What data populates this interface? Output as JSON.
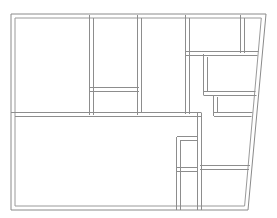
{
  "document": {
    "type": "architectural-floor-plan",
    "title": "Floor Plan",
    "canvas_width": 277,
    "canvas_height": 218,
    "background_color": "#ffffff",
    "wall_stroke_color": "#8d8d8d",
    "wall_style": "double-line",
    "wall_thickness_px": 4
  },
  "geometry": {
    "outline": {
      "name": "building-outline",
      "description": "Rectangular plan with slanted right edge",
      "outer_points": [
        [
          11,
          14
        ],
        [
          266,
          14
        ],
        [
          248,
          210
        ],
        [
          11,
          210
        ]
      ],
      "inner_points": [
        [
          15,
          18
        ],
        [
          261,
          18
        ],
        [
          244,
          206
        ],
        [
          15,
          206
        ]
      ]
    },
    "interior_walls": [
      {
        "name": "wall-vertical-left-room-right-edge",
        "orientation": "vertical",
        "x": 91,
        "y1": 14,
        "y2": 115
      },
      {
        "name": "wall-horizontal-upper-middle-stub",
        "orientation": "horizontal",
        "y": 89,
        "x1": 91,
        "x2": 139
      },
      {
        "name": "wall-vertical-center",
        "orientation": "vertical",
        "x": 139,
        "y1": 14,
        "y2": 115
      },
      {
        "name": "wall-horizontal-main-divider",
        "orientation": "horizontal",
        "y": 115,
        "x1": 11,
        "x2": 200
      },
      {
        "name": "wall-vertical-right-corridor-left",
        "orientation": "vertical",
        "x": 187,
        "y1": 14,
        "y2": 115
      },
      {
        "name": "wall-horizontal-right-corridor-top-divider",
        "orientation": "horizontal",
        "y": 53,
        "x1": 187,
        "x2": 258
      },
      {
        "name": "wall-vertical-top-right-small-room",
        "orientation": "vertical",
        "x": 242,
        "y1": 14,
        "y2": 53
      },
      {
        "name": "wall-vertical-upper-right-room-left",
        "orientation": "vertical",
        "x": 203,
        "y1": 55,
        "y2": 95
      },
      {
        "name": "wall-horizontal-upper-right-room-bottom",
        "orientation": "horizontal",
        "y": 95,
        "x1": 203,
        "x2": 256
      },
      {
        "name": "wall-vertical-mid-right-small-room-left",
        "orientation": "vertical",
        "x": 214,
        "y1": 95,
        "y2": 115
      },
      {
        "name": "wall-horizontal-mid-right-small-room-bottom",
        "orientation": "horizontal",
        "y": 115,
        "x1": 214,
        "x2": 253
      },
      {
        "name": "wall-vertical-lower-center-right",
        "orientation": "vertical",
        "x": 200,
        "y1": 115,
        "y2": 210
      },
      {
        "name": "wall-vertical-lower-narrow-room-left",
        "orientation": "vertical",
        "x": 178,
        "y1": 138,
        "y2": 210
      },
      {
        "name": "wall-horizontal-lower-narrow-room-top",
        "orientation": "horizontal",
        "y": 138,
        "x1": 178,
        "x2": 200
      },
      {
        "name": "wall-horizontal-lower-narrow-room-split",
        "orientation": "horizontal",
        "y": 170,
        "x1": 178,
        "x2": 200
      },
      {
        "name": "wall-horizontal-lower-right-room-top",
        "orientation": "horizontal",
        "y": 168,
        "x1": 200,
        "x2": 250
      }
    ],
    "rooms": [
      {
        "name": "room-top-left",
        "bounds": [
          15,
          18,
          89,
          113
        ]
      },
      {
        "name": "room-top-center-upper",
        "bounds": [
          93,
          18,
          137,
          87
        ]
      },
      {
        "name": "room-center",
        "bounds": [
          93,
          91,
          137,
          113
        ]
      },
      {
        "name": "room-top-center-right",
        "bounds": [
          141,
          18,
          185,
          113
        ]
      },
      {
        "name": "room-top-right-wide",
        "bounds": [
          189,
          18,
          240,
          51
        ]
      },
      {
        "name": "room-top-right-narrow",
        "bounds": [
          244,
          18,
          262,
          51
        ]
      },
      {
        "name": "room-right-upper",
        "bounds": [
          205,
          55,
          256,
          93
        ]
      },
      {
        "name": "room-right-mid-small",
        "bounds": [
          216,
          97,
          252,
          113
        ]
      },
      {
        "name": "room-bottom-left-large",
        "bounds": [
          15,
          117,
          198,
          206
        ]
      },
      {
        "name": "room-lower-narrow-upper",
        "bounds": [
          180,
          140,
          198,
          168
        ]
      },
      {
        "name": "room-lower-narrow-lower",
        "bounds": [
          180,
          172,
          198,
          206
        ]
      },
      {
        "name": "room-bottom-right",
        "bounds": [
          202,
          170,
          246,
          206
        ]
      },
      {
        "name": "room-right-corridor",
        "bounds": [
          189,
          55,
          201,
          113
        ]
      }
    ]
  }
}
